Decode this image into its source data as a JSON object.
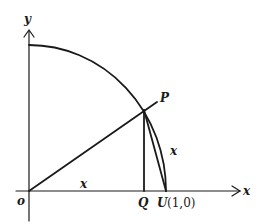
{
  "diagram": {
    "labels": {
      "y_axis": "y",
      "x_axis": "x",
      "origin": "o",
      "point_p": "P",
      "point_q": "Q",
      "point_u": "U",
      "point_u_coords": "(1,0)",
      "segment_op": "x",
      "arc_pu": "x"
    },
    "colors": {
      "ink": "#1a1a1a",
      "background": "#ffffff"
    }
  }
}
